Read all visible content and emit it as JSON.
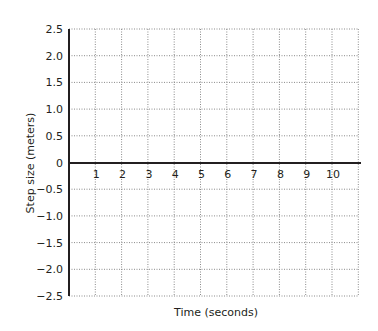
{
  "chart_data": {
    "type": "line",
    "title": "",
    "xlabel": "Time (seconds)",
    "ylabel": "Step size (meters)",
    "xlim": [
      0,
      11
    ],
    "ylim": [
      -2.5,
      2.5
    ],
    "x_ticks": [
      "1",
      "2",
      "3",
      "4",
      "5",
      "6",
      "7",
      "8",
      "9",
      "10"
    ],
    "y_ticks": [
      "2.5",
      "2.0",
      "1.5",
      "1.0",
      "0.5",
      "0",
      "−0.5",
      "−1.0",
      "−1.5",
      "−2.0",
      "−2.5"
    ],
    "y_tick_values": [
      2.5,
      2.0,
      1.5,
      1.0,
      0.5,
      0,
      -0.5,
      -1.0,
      -1.5,
      -2.0,
      -2.5
    ],
    "series": [],
    "grid": true,
    "grid_style": "dotted",
    "legend": null
  },
  "colors": {
    "axis": "#231f20",
    "grid": "#8a8a8a",
    "text": "#231f20"
  }
}
